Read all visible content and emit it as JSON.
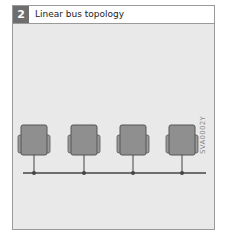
{
  "figure": {
    "number": "2",
    "title": "Linear bus topology",
    "code": "SVA0002Y"
  },
  "diagram": {
    "nodes": [
      {
        "label": "station-1"
      },
      {
        "label": "station-2"
      },
      {
        "label": "station-3"
      },
      {
        "label": "station-4"
      }
    ],
    "colors": {
      "panel_bg": "#e9e9e9",
      "monitor_fill": "#8f8f8f",
      "monitor_border": "#555555",
      "bus_line": "#444444",
      "number_box": "#6e6e6e"
    }
  }
}
